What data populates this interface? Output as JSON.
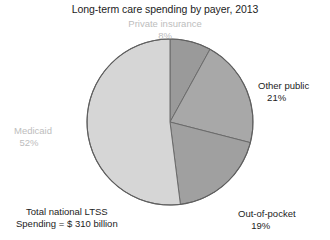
{
  "chart_data": {
    "type": "pie",
    "title": "Long-term care spending by payer, 2013",
    "subtitle": "",
    "xlabel": "",
    "ylabel": "",
    "units": "percent of total spending",
    "grid": false,
    "legend_position": "none",
    "labels_on_slices": true,
    "start_angle_deg": 0,
    "direction": "clockwise",
    "categories": [
      "Private insurance",
      "Other public",
      "Out-of-pocket",
      "Medicaid"
    ],
    "values": [
      8,
      21,
      19,
      52
    ],
    "slices": [
      {
        "name": "Private insurance",
        "label": "Private insurance",
        "value": 8,
        "value_label": "8%",
        "color": "#9a9a9a",
        "label_color": "#bdbdbd",
        "start_deg": 0,
        "end_deg": 28.8
      },
      {
        "name": "Other public",
        "label": "Other public",
        "value": 21,
        "value_label": "21%",
        "color": "#a8a8a8",
        "label_color": "#1c1c1c",
        "start_deg": 28.8,
        "end_deg": 104.4
      },
      {
        "name": "Out-of-pocket",
        "label": "Out-of-pocket",
        "value": 19,
        "value_label": "19%",
        "color": "#a0a0a0",
        "label_color": "#1c1c1c",
        "start_deg": 104.4,
        "end_deg": 172.8
      },
      {
        "name": "Medicaid",
        "label": "Medicaid",
        "value": 52,
        "value_label": "52%",
        "color": "#d6d6d6",
        "label_color": "#bdbdbd",
        "start_deg": 172.8,
        "end_deg": 360
      }
    ],
    "annotations": [
      {
        "name": "total-spending",
        "line1": "Total national LTSS",
        "line2": "Spending = $ 310 billion"
      }
    ],
    "stroke_color": "#6b6b6b",
    "background": "#ffffff"
  },
  "figure": {
    "title": "Long-term care spending by payer, 2013",
    "total_note_line1": "Total national LTSS",
    "total_note_line2": "Spending = $ 310 billion"
  }
}
